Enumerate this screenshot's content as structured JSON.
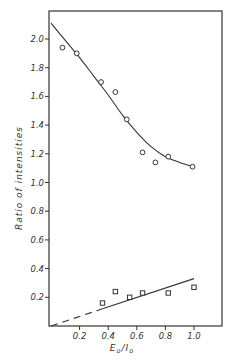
{
  "chart_data": {
    "type": "scatter",
    "title": "",
    "xlabel": "E₀/I₀",
    "ylabel": "Ratio  of  intensities",
    "xlim": [
      0,
      1.2
    ],
    "ylim": [
      0,
      2.1
    ],
    "grid": false,
    "legend": null,
    "x_ticks": [
      0.2,
      0.4,
      0.6,
      0.8,
      1.0
    ],
    "x_tick_labels": [
      "0.2",
      "0.4",
      "0.6",
      "0.8",
      "1.0"
    ],
    "y_ticks": [
      0.2,
      0.4,
      0.6,
      0.8,
      1.0,
      1.2,
      1.4,
      1.6,
      1.8,
      2.0
    ],
    "y_tick_labels": [
      "0.2",
      "0.4",
      "0.6",
      "0.8",
      "1.0",
      "1.2",
      "1.4",
      "1.6",
      "1.8",
      "2.0"
    ],
    "series": [
      {
        "name": "upper (circles)",
        "marker": "circle",
        "x": [
          0.08,
          0.18,
          0.35,
          0.45,
          0.53,
          0.64,
          0.73,
          0.82,
          0.99
        ],
        "y": [
          1.94,
          1.9,
          1.7,
          1.63,
          1.44,
          1.21,
          1.14,
          1.18,
          1.11
        ]
      },
      {
        "name": "lower (squares)",
        "marker": "square",
        "x": [
          0.36,
          0.45,
          0.55,
          0.64,
          0.82,
          1.0
        ],
        "y": [
          0.16,
          0.24,
          0.2,
          0.23,
          0.23,
          0.27
        ]
      }
    ],
    "fit_lines": [
      {
        "name": "upper fitted curve",
        "style": "solid",
        "x": [
          0.0,
          0.1,
          0.2,
          0.3,
          0.4,
          0.5,
          0.6,
          0.7,
          0.8,
          0.9,
          1.0
        ],
        "y": [
          2.11,
          1.99,
          1.87,
          1.74,
          1.61,
          1.47,
          1.35,
          1.25,
          1.18,
          1.14,
          1.11
        ]
      },
      {
        "name": "lower fitted line (extrapolated)",
        "style": "dashed",
        "x": [
          0.0,
          0.36
        ],
        "y": [
          0.0,
          0.12
        ]
      },
      {
        "name": "lower fitted line",
        "style": "solid",
        "x": [
          0.36,
          1.0
        ],
        "y": [
          0.12,
          0.33
        ]
      }
    ]
  }
}
